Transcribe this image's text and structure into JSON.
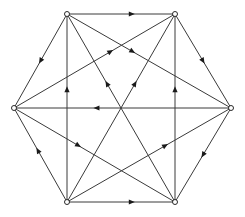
{
  "diagram": {
    "type": "directed-graph",
    "colors": {
      "edge": "#3a3a3a",
      "arrow": "#1a1a1a",
      "node_fill": "#ffffff",
      "node_stroke": "#2a2a2a"
    },
    "nodes": [
      {
        "id": "A",
        "x": 67,
        "y": 14
      },
      {
        "id": "B",
        "x": 175,
        "y": 14
      },
      {
        "id": "C",
        "x": 14,
        "y": 108
      },
      {
        "id": "D",
        "x": 231,
        "y": 108
      },
      {
        "id": "E",
        "x": 67,
        "y": 202
      },
      {
        "id": "F",
        "x": 175,
        "y": 202
      }
    ],
    "edges": [
      {
        "from": "A",
        "to": "B",
        "arrow_t": 0.6
      },
      {
        "from": "E",
        "to": "F",
        "arrow_t": 0.6
      },
      {
        "from": "D",
        "to": "C",
        "arrow_t": 0.62
      },
      {
        "from": "A",
        "to": "C",
        "arrow_t": 0.5
      },
      {
        "from": "E",
        "to": "C",
        "arrow_t": 0.55
      },
      {
        "from": "B",
        "to": "D",
        "arrow_t": 0.5
      },
      {
        "from": "D",
        "to": "F",
        "arrow_t": 0.5
      },
      {
        "from": "E",
        "to": "A",
        "arrow_t": 0.6
      },
      {
        "from": "F",
        "to": "B",
        "arrow_t": 0.6
      },
      {
        "from": "C",
        "to": "B",
        "arrow_t": 0.6
      },
      {
        "from": "A",
        "to": "D",
        "arrow_t": 0.4
      },
      {
        "from": "C",
        "to": "F",
        "arrow_t": 0.4
      },
      {
        "from": "E",
        "to": "D",
        "arrow_t": 0.6
      },
      {
        "from": "E",
        "to": "B",
        "arrow_t": 0.63
      },
      {
        "from": "F",
        "to": "A",
        "arrow_t": 0.63
      }
    ]
  }
}
